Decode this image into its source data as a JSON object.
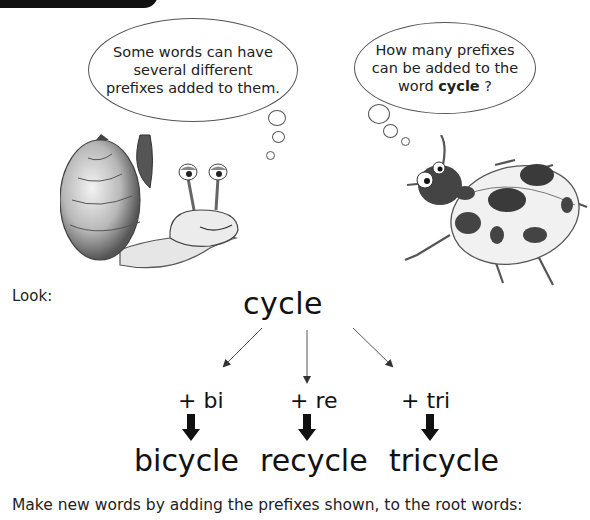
{
  "bubbles": {
    "snail": {
      "line1": "Some words can have",
      "line2": "several different",
      "line3": "prefixes added to them."
    },
    "ladybird": {
      "line1": "How many prefixes",
      "line2": "can be added to the",
      "line3_prefix": "word ",
      "line3_bold": "cycle",
      "line3_suffix": " ?"
    }
  },
  "look_label": "Look:",
  "root_word": "cycle",
  "prefixes": [
    {
      "label": "+ bi",
      "result": "bicycle"
    },
    {
      "label": "+ re",
      "result": "recycle"
    },
    {
      "label": "+ tri",
      "result": "tricycle"
    }
  ],
  "instruction": "Make new words by adding the prefixes shown, to the root words:"
}
